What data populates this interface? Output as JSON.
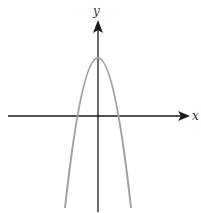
{
  "diagram": {
    "type": "function-graph",
    "axes": {
      "x_label": "x",
      "y_label": "y"
    },
    "curve": {
      "shape": "parabola",
      "opens": "down",
      "vertex": "on positive y-axis",
      "x_intercepts": "two, symmetric about y-axis"
    },
    "colors": {
      "axis": "#1a1a1a",
      "curve": "#a0a0a0",
      "background": "#ffffff"
    }
  }
}
